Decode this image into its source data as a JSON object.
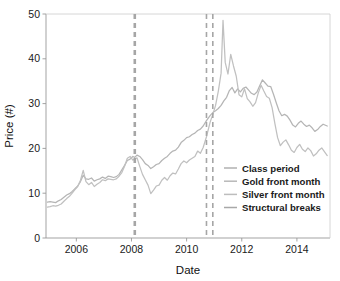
{
  "chart_data": {
    "type": "line",
    "title": "",
    "xlabel": "Date",
    "ylabel": "Price (#)",
    "xlim": [
      2004.9,
      2015.2
    ],
    "ylim": [
      0,
      50
    ],
    "xticks": [
      "2006",
      "2008",
      "2010",
      "2012",
      "2014"
    ],
    "xtick_values": [
      2006,
      2008,
      2010,
      2012,
      2014
    ],
    "yticks": [
      "0",
      "10",
      "20",
      "30",
      "40",
      "50"
    ],
    "ytick_values": [
      0,
      10,
      20,
      30,
      40,
      50
    ],
    "grid": false,
    "legend_position": "lower right",
    "legend": [
      {
        "label": "Class period",
        "color": "#b0b0b0",
        "style": "solid"
      },
      {
        "label": "Gold front month",
        "color": "#b8b8b8",
        "style": "solid"
      },
      {
        "label": "Silver front month",
        "color": "#bdbdbd",
        "style": "solid"
      },
      {
        "label": "Structural breaks",
        "color": "#a8a8a8",
        "style": "dashed"
      }
    ],
    "structural_breaks": [
      2008.12,
      2010.72,
      2010.95
    ],
    "class_period_start": 2008.12,
    "series": [
      {
        "name": "Gold front month",
        "color": "#b5b5b5",
        "x": [
          2004.95,
          2005.05,
          2005.15,
          2005.25,
          2005.35,
          2005.45,
          2005.55,
          2005.65,
          2005.75,
          2005.85,
          2005.95,
          2006.05,
          2006.15,
          2006.25,
          2006.35,
          2006.45,
          2006.55,
          2006.65,
          2006.75,
          2006.85,
          2006.95,
          2007.05,
          2007.15,
          2007.25,
          2007.35,
          2007.45,
          2007.55,
          2007.65,
          2007.75,
          2007.85,
          2007.95,
          2008.05,
          2008.12,
          2008.2,
          2008.3,
          2008.4,
          2008.5,
          2008.6,
          2008.7,
          2008.8,
          2008.9,
          2009.0,
          2009.1,
          2009.2,
          2009.3,
          2009.4,
          2009.5,
          2009.6,
          2009.7,
          2009.8,
          2009.9,
          2010.0,
          2010.1,
          2010.2,
          2010.3,
          2010.4,
          2010.5,
          2010.6,
          2010.72,
          2010.85,
          2010.95,
          2011.05,
          2011.15,
          2011.25,
          2011.35,
          2011.45,
          2011.55,
          2011.65,
          2011.75,
          2011.85,
          2011.95,
          2012.05,
          2012.15,
          2012.25,
          2012.35,
          2012.45,
          2012.55,
          2012.65,
          2012.75,
          2012.85,
          2012.95,
          2013.05,
          2013.15,
          2013.25,
          2013.35,
          2013.45,
          2013.55,
          2013.65,
          2013.75,
          2013.85,
          2013.95,
          2014.05,
          2014.15,
          2014.25,
          2014.35,
          2014.45,
          2014.55,
          2014.65,
          2014.75,
          2014.85,
          2014.95,
          2015.1
        ],
        "y": [
          8.0,
          8.1,
          8.0,
          7.9,
          8.3,
          8.6,
          9.1,
          9.6,
          9.9,
          10.4,
          11.0,
          11.6,
          12.6,
          14.0,
          13.2,
          13.1,
          13.4,
          12.7,
          13.0,
          13.2,
          13.6,
          13.3,
          13.8,
          13.7,
          13.5,
          13.7,
          14.2,
          15.2,
          16.2,
          17.3,
          17.6,
          18.2,
          18.0,
          18.5,
          18.2,
          17.5,
          16.6,
          16.2,
          15.5,
          15.9,
          16.4,
          16.6,
          17.3,
          17.8,
          18.2,
          18.9,
          19.4,
          19.6,
          20.3,
          21.3,
          21.8,
          22.4,
          22.6,
          23.1,
          23.4,
          24.0,
          24.3,
          25.0,
          26.2,
          27.3,
          28.0,
          28.4,
          28.9,
          29.6,
          30.6,
          31.4,
          32.9,
          33.6,
          32.4,
          33.3,
          32.6,
          33.4,
          33.7,
          33.0,
          32.3,
          32.0,
          32.6,
          34.0,
          35.3,
          34.6,
          33.9,
          33.8,
          32.1,
          30.2,
          28.4,
          27.3,
          27.6,
          27.2,
          26.3,
          25.2,
          24.8,
          25.6,
          26.1,
          25.4,
          24.9,
          25.2,
          24.6,
          23.8,
          24.2,
          24.9,
          25.4,
          25.0
        ]
      },
      {
        "name": "Silver front month",
        "color": "#c0c0c0",
        "x": [
          2004.95,
          2005.05,
          2005.15,
          2005.25,
          2005.35,
          2005.45,
          2005.55,
          2005.65,
          2005.75,
          2005.85,
          2005.95,
          2006.05,
          2006.15,
          2006.25,
          2006.35,
          2006.45,
          2006.55,
          2006.65,
          2006.75,
          2006.85,
          2006.95,
          2007.05,
          2007.15,
          2007.25,
          2007.35,
          2007.45,
          2007.55,
          2007.65,
          2007.75,
          2007.85,
          2007.95,
          2008.05,
          2008.12,
          2008.2,
          2008.3,
          2008.4,
          2008.5,
          2008.6,
          2008.7,
          2008.8,
          2008.9,
          2009.0,
          2009.1,
          2009.2,
          2009.3,
          2009.4,
          2009.5,
          2009.6,
          2009.7,
          2009.8,
          2009.9,
          2010.0,
          2010.1,
          2010.2,
          2010.3,
          2010.4,
          2010.5,
          2010.6,
          2010.72,
          2010.85,
          2010.95,
          2011.05,
          2011.15,
          2011.25,
          2011.32,
          2011.4,
          2011.5,
          2011.6,
          2011.7,
          2011.8,
          2011.9,
          2012.0,
          2012.1,
          2012.2,
          2012.3,
          2012.4,
          2012.5,
          2012.6,
          2012.7,
          2012.8,
          2012.9,
          2013.0,
          2013.1,
          2013.2,
          2013.3,
          2013.4,
          2013.5,
          2013.6,
          2013.7,
          2013.8,
          2013.9,
          2014.0,
          2014.1,
          2014.2,
          2014.3,
          2014.4,
          2014.5,
          2014.6,
          2014.7,
          2014.8,
          2014.9,
          2015.1
        ],
        "y": [
          6.9,
          7.0,
          7.2,
          7.1,
          7.3,
          7.6,
          8.2,
          8.8,
          9.3,
          10.0,
          10.8,
          11.5,
          12.9,
          15.1,
          12.6,
          11.9,
          12.4,
          11.5,
          12.0,
          12.4,
          13.0,
          12.8,
          13.2,
          13.1,
          13.0,
          13.2,
          13.8,
          14.6,
          16.0,
          17.8,
          18.2,
          17.4,
          17.6,
          17.9,
          16.0,
          14.2,
          13.0,
          11.8,
          9.9,
          10.7,
          11.6,
          11.8,
          12.9,
          13.5,
          12.9,
          13.9,
          14.5,
          14.3,
          15.4,
          16.6,
          17.2,
          16.8,
          17.4,
          17.8,
          18.2,
          19.4,
          18.9,
          20.2,
          22.6,
          25.8,
          27.6,
          29.6,
          32.8,
          36.8,
          48.6,
          39.2,
          36.6,
          41.0,
          38.4,
          36.1,
          32.0,
          31.5,
          33.3,
          31.1,
          30.4,
          29.4,
          30.2,
          32.4,
          34.1,
          32.8,
          31.6,
          31.2,
          29.1,
          25.6,
          22.4,
          20.6,
          21.4,
          21.9,
          20.8,
          19.6,
          19.1,
          20.2,
          20.9,
          19.8,
          19.3,
          20.1,
          19.5,
          18.3,
          18.8,
          19.6,
          20.1,
          18.4
        ]
      }
    ]
  }
}
